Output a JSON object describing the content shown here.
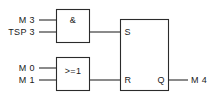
{
  "diagram": {
    "type": "function-block-diagram",
    "title": "",
    "colors": {
      "line": "#2b2b2b",
      "text": "#1a1a1a",
      "background": "#ffffff"
    },
    "blocks": [
      {
        "id": "and-gate",
        "symbol": "&",
        "function": "AND",
        "inputs": [
          "M 3",
          "TSP 3"
        ],
        "output_to": "S"
      },
      {
        "id": "or-gate",
        "symbol": ">=1",
        "function": "OR",
        "inputs": [
          "M 0",
          "M 1"
        ],
        "output_to": "R"
      },
      {
        "id": "rs-flipflop",
        "symbol": "",
        "function": "RS",
        "pins": {
          "set": "S",
          "reset": "R",
          "out": "Q"
        },
        "output_to": "M 4"
      }
    ],
    "signals": {
      "and_input_1": "M 3",
      "and_input_2": "TSP 3",
      "or_input_1": "M 0",
      "or_input_2": "M 1",
      "output": "M 4"
    },
    "pins": {
      "set": "S",
      "reset": "R",
      "q": "Q"
    },
    "gate_symbols": {
      "and": "&",
      "or": ">=1"
    }
  }
}
